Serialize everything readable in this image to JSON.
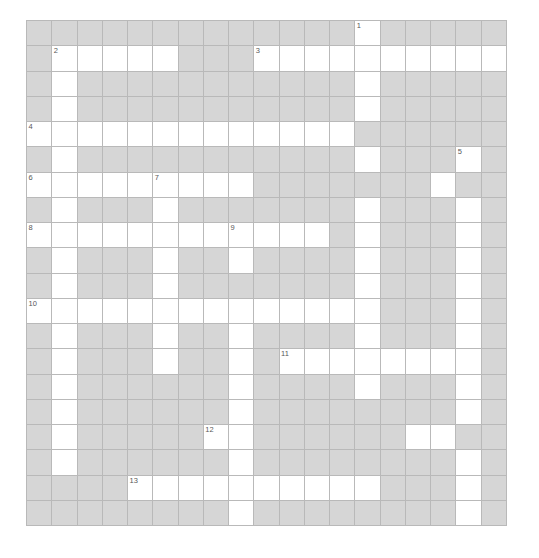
{
  "puzzle": {
    "title": "Crossword Grid",
    "type": "crossword",
    "columns": 19,
    "rows": 20,
    "cell_size_px": 25.25,
    "origin": {
      "x": 26,
      "y": 20
    },
    "colors": {
      "block_fill": "#d6d6d6",
      "open_fill": "#ffffff",
      "grid_line": "#b9b9b9",
      "number_text": "#585858",
      "page_background": "#ffffff"
    },
    "legend": {
      "open_cell_meaning": "fillable letter square",
      "block_cell_meaning": "shaded blocked square"
    },
    "clue_numbers_visible": [
      "1",
      "2",
      "3",
      "4",
      "5",
      "6",
      "7",
      "8",
      "9",
      "10",
      "11",
      "12",
      "13",
      "14"
    ],
    "numbers": [
      {
        "label": "1",
        "row": 0,
        "col": 13
      },
      {
        "label": "2",
        "row": 1,
        "col": 1
      },
      {
        "label": "3",
        "row": 1,
        "col": 9
      },
      {
        "label": "4",
        "row": 4,
        "col": 0
      },
      {
        "label": "5",
        "row": 5,
        "col": 17
      },
      {
        "label": "6",
        "row": 6,
        "col": 0
      },
      {
        "label": "7",
        "row": 6,
        "col": 5
      },
      {
        "label": "8",
        "row": 8,
        "col": 0
      },
      {
        "label": "9",
        "row": 8,
        "col": 8
      },
      {
        "label": "10",
        "row": 11,
        "col": 0
      },
      {
        "label": "11",
        "row": 13,
        "col": 10
      },
      {
        "label": "12",
        "row": 16,
        "col": 7
      },
      {
        "label": "13",
        "row": 18,
        "col": 4
      },
      {
        "label": "14",
        "row": 20,
        "col": 7
      }
    ],
    "grid": [
      "BBBBBBBBBBBBBOBBBBB",
      "BOOOOOBBBOOOOOOOOOO",
      "BOBBBBBBBBBBBOBBBBB",
      "BOBBBBBBBBBBBOBBBBB",
      "OOOOOOOOOOOOOBBBBBB",
      "BOBBBBBBBBBBBOBBBOB",
      "OOOOOOOOOBBBBBBBOBB",
      "BOBBBOBBBBBBBOBBBOB",
      "OOOOOOOOOOOOBOBBBOB",
      "BOBBBOBBOBBBBOBBBOB",
      "BOBBBOBBBBBBBOBBBOB",
      "OOOOOOOOOOOOOOBBBOB",
      "BOBBBOBBOBBBBOBBBOB",
      "BOBBBOBBOBOOOOOOOOB",
      "BOBBBBBBOBBBBOBBBOB",
      "BOBBBBBBOBBBBBBBBOB",
      "BOBBBBBOOBBBBBBOOBB",
      "BOBBBBBBOBBBBBBBBOB",
      "BBBBOOOOOOOOOOBBBOB",
      "BBBBBBBBOBBBBBBBBOB",
      "BBBBBBBOOOOOOOOBBBB"
    ]
  }
}
